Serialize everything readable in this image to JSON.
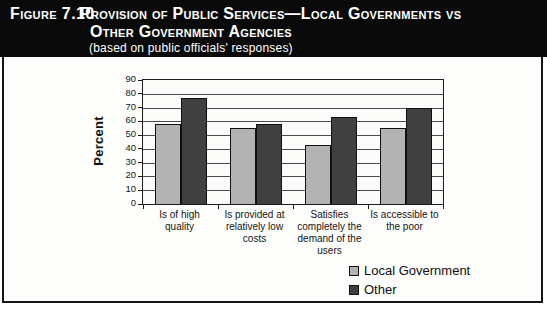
{
  "figure": {
    "label": "Figure 7.10",
    "title_line1": "Provision of Public Services—Local Governments vs",
    "title_line2": "Other Government Agencies",
    "subtitle": "(based on public officials' responses)"
  },
  "chart_data": {
    "type": "bar",
    "title": "Provision of Public Services—Local Governments vs Other Government Agencies (based on public officials' responses)",
    "xlabel": "",
    "ylabel": "Percent",
    "ylim": [
      0,
      90
    ],
    "ytick_step": 10,
    "grid": true,
    "legend_position": "bottom-right",
    "categories": [
      "Is of high quality",
      "Is provided at relatively low costs",
      "Satisfies completely the demand of the users",
      "Is accessible to the poor"
    ],
    "category_lines": [
      [
        "Is of high quality"
      ],
      [
        "Is provided at",
        "relatively low",
        "costs"
      ],
      [
        "Satisfies",
        "completely the",
        "demand of the",
        "users"
      ],
      [
        "Is accessible to",
        "the poor"
      ]
    ],
    "series": [
      {
        "name": "Local Government",
        "color": "#b3b3b3",
        "values": [
          58,
          55,
          43,
          55
        ]
      },
      {
        "name": "Other",
        "color": "#404040",
        "values": [
          77,
          58,
          63,
          70
        ]
      }
    ]
  }
}
